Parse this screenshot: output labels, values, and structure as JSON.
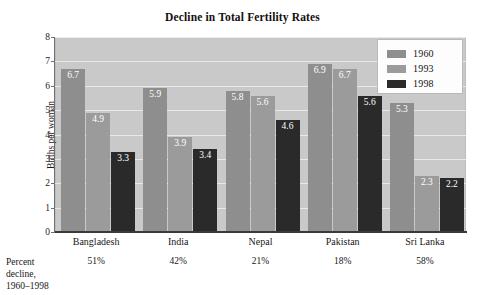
{
  "chart_data": {
    "type": "bar",
    "title": "Decline in Total Fertility Rates",
    "xlabel": "",
    "ylabel": "Births per woman",
    "ylim": [
      0,
      8
    ],
    "yticks": [
      0,
      1,
      2,
      3,
      4,
      5,
      6,
      7,
      8
    ],
    "grid": true,
    "legend_position": "top-right",
    "categories": [
      "Bangladesh",
      "India",
      "Nepal",
      "Pakistan",
      "Sri Lanka"
    ],
    "series": [
      {
        "name": "1960",
        "color": "#8e8e8e",
        "values": [
          6.7,
          5.9,
          5.8,
          6.9,
          5.3
        ]
      },
      {
        "name": "1993",
        "color": "#9b9b9b",
        "values": [
          4.9,
          3.9,
          5.6,
          6.7,
          2.3
        ]
      },
      {
        "name": "1998",
        "color": "#2a2a2a",
        "values": [
          3.3,
          3.4,
          4.6,
          5.6,
          2.2
        ]
      }
    ],
    "annotations": {
      "footer_label": [
        "Percent",
        "decline,",
        "1960–1998"
      ],
      "percent_decline": [
        "51%",
        "42%",
        "21%",
        "18%",
        "58%"
      ]
    }
  }
}
